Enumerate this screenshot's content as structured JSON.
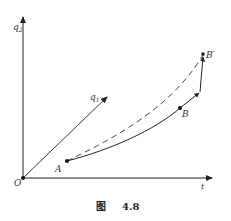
{
  "figure": {
    "caption": {
      "prefix": "图",
      "number": "4.8"
    },
    "axes": {
      "vertical": {
        "label": "q",
        "subscript": "2"
      },
      "diagonal": {
        "label": "q",
        "subscript": "1"
      },
      "horizontal": {
        "label": "t"
      },
      "origin": {
        "label": "O"
      }
    },
    "points": {
      "A": {
        "label": "A"
      },
      "B": {
        "label": "B"
      },
      "B_prime": {
        "label": "B′"
      }
    },
    "curves": [
      {
        "name": "solid-path-A-to-B-prime",
        "style": "solid",
        "description": "Actual path from A through B to B′"
      },
      {
        "name": "dashed-path-A-to-B-prime",
        "style": "dashed",
        "description": "Varied path from A to B′"
      }
    ],
    "colors": {
      "line": "#222222",
      "text": "#333333",
      "background": "#ffffff"
    }
  }
}
